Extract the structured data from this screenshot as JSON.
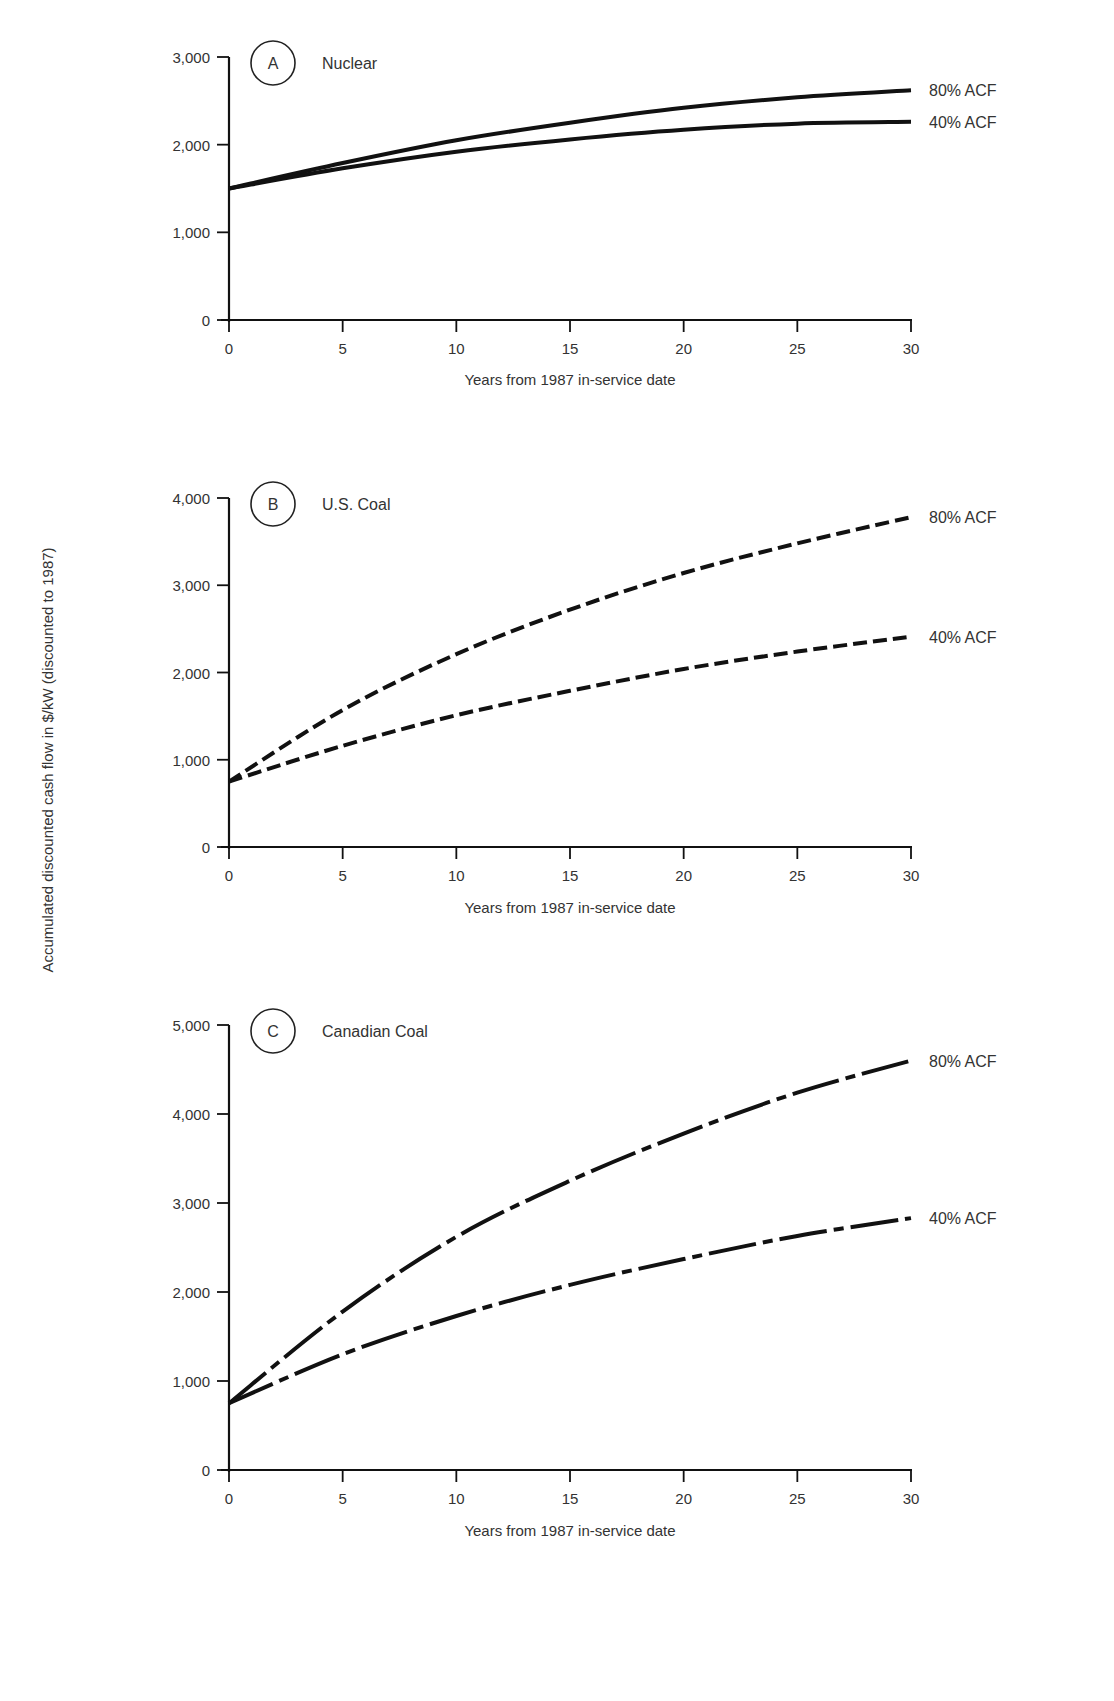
{
  "ylabel": "Accumulated discounted cash flow in $/kW (discounted to 1987)",
  "chart_data": [
    {
      "type": "line",
      "panel": "A",
      "title": "Nuclear",
      "xlabel": "Years from 1987 in-service date",
      "ylabel": "Accumulated discounted cash flow in $/kW (discounted to 1987)",
      "x": [
        0,
        5,
        10,
        15,
        20,
        25,
        30
      ],
      "xticks": [
        "0",
        "5",
        "10",
        "15",
        "20",
        "25",
        "30"
      ],
      "yticks": [
        "0",
        "1,000",
        "2,000",
        "3,000"
      ],
      "ytick_values": [
        0,
        1000,
        2000,
        3000
      ],
      "xlim": [
        0,
        30
      ],
      "ylim": [
        0,
        3000
      ],
      "line_style": "solid",
      "grid": false,
      "series": [
        {
          "name": "80% ACF",
          "values": [
            1500,
            1790,
            2050,
            2250,
            2420,
            2540,
            2620
          ]
        },
        {
          "name": "40% ACF",
          "values": [
            1500,
            1730,
            1920,
            2060,
            2170,
            2240,
            2260
          ]
        }
      ]
    },
    {
      "type": "line",
      "panel": "B",
      "title": "U.S. Coal",
      "xlabel": "Years from 1987 in-service date",
      "ylabel": "Accumulated discounted cash flow in $/kW (discounted to 1987)",
      "x": [
        0,
        5,
        10,
        15,
        20,
        25,
        30
      ],
      "xticks": [
        "0",
        "5",
        "10",
        "15",
        "20",
        "25",
        "30"
      ],
      "yticks": [
        "0",
        "1,000",
        "2,000",
        "3,000",
        "4,000"
      ],
      "ytick_values": [
        0,
        1000,
        2000,
        3000,
        4000
      ],
      "xlim": [
        0,
        30
      ],
      "ylim": [
        0,
        4000
      ],
      "line_style": "dashed",
      "grid": false,
      "series": [
        {
          "name": "80% ACF",
          "values": [
            750,
            1570,
            2210,
            2720,
            3140,
            3480,
            3780
          ]
        },
        {
          "name": "40% ACF",
          "values": [
            750,
            1160,
            1510,
            1790,
            2040,
            2240,
            2410
          ]
        }
      ]
    },
    {
      "type": "line",
      "panel": "C",
      "title": "Canadian Coal",
      "xlabel": "Years from 1987 in-service date",
      "ylabel": "Accumulated discounted cash flow in $/kW (discounted to 1987)",
      "x": [
        0,
        5,
        10,
        15,
        20,
        25,
        30
      ],
      "xticks": [
        "0",
        "5",
        "10",
        "15",
        "20",
        "25",
        "30"
      ],
      "yticks": [
        "0",
        "1,000",
        "2,000",
        "3,000",
        "4,000",
        "5,000"
      ],
      "ytick_values": [
        0,
        1000,
        2000,
        3000,
        4000,
        5000
      ],
      "xlim": [
        0,
        30
      ],
      "ylim": [
        0,
        5000
      ],
      "line_style": "dash-dot",
      "grid": false,
      "series": [
        {
          "name": "80% ACF",
          "values": [
            750,
            1780,
            2620,
            3250,
            3780,
            4240,
            4600
          ]
        },
        {
          "name": "40% ACF",
          "values": [
            750,
            1300,
            1730,
            2080,
            2370,
            2630,
            2830
          ]
        }
      ]
    }
  ]
}
